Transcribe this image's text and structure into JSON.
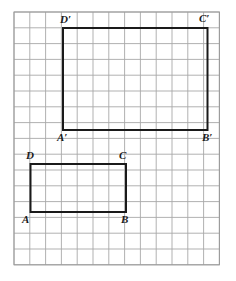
{
  "figure": {
    "background_color": "#ffffff",
    "grid": {
      "origin_x": 14,
      "origin_y": 12,
      "cell": 15.8,
      "cols": 13,
      "rows": 16,
      "line_color": "#a8a8a8",
      "line_width": 0.9,
      "border_color": "#9a9a9a",
      "border_width": 1.0
    },
    "shapes": [
      {
        "name": "rectangle-abcd",
        "stroke_color": "#1a1a1a",
        "stroke_width": 2.0,
        "fill": "none",
        "x": 30.5,
        "y": 164.0,
        "width": 95.5,
        "height": 48.0,
        "corner_cells": {
          "left_col": 1,
          "right_col": 7,
          "top_row": 9.62,
          "bottom_row": 12.66
        }
      },
      {
        "name": "rectangle-a-prime-b-prime-c-prime-d-prime",
        "stroke_color": "#1a1a1a",
        "stroke_width": 2.0,
        "fill": "none",
        "x": 63.0,
        "y": 28.0,
        "width": 144.5,
        "height": 102.0,
        "corner_cells": {
          "left_col": 3.1,
          "right_col": 12.25,
          "top_row": 1.0,
          "bottom_row": 7.47
        }
      }
    ],
    "labels": [
      {
        "text": "D",
        "name": "vertex-label-d",
        "x": 26,
        "y": 150
      },
      {
        "text": "C",
        "name": "vertex-label-c",
        "x": 119,
        "y": 150
      },
      {
        "text": "A",
        "name": "vertex-label-a",
        "x": 22,
        "y": 214
      },
      {
        "text": "B",
        "name": "vertex-label-b",
        "x": 121,
        "y": 214
      },
      {
        "text": "D′",
        "name": "vertex-label-d-prime",
        "x": 60,
        "y": 14
      },
      {
        "text": "C′",
        "name": "vertex-label-c-prime",
        "x": 199,
        "y": 13
      },
      {
        "text": "A′",
        "name": "vertex-label-a-prime",
        "x": 57,
        "y": 132
      },
      {
        "text": "B′",
        "name": "vertex-label-b-prime",
        "x": 202,
        "y": 132
      }
    ]
  }
}
